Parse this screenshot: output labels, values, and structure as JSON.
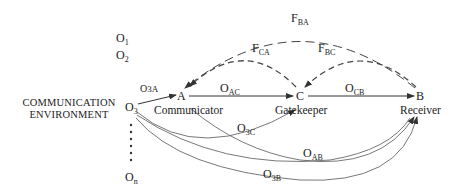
{
  "environment_label": [
    "COMMUNICATION",
    "ENVIRONMENT"
  ],
  "objects": [
    {
      "id": "O1",
      "base": "O",
      "sub": "1"
    },
    {
      "id": "O2",
      "base": "O",
      "sub": "2"
    },
    {
      "id": "O3",
      "base": "O",
      "sub": "3"
    },
    {
      "id": "On",
      "base": "O",
      "sub": "n"
    }
  ],
  "nodes": [
    {
      "id": "A",
      "letter": "A",
      "role": "Communicator"
    },
    {
      "id": "C",
      "letter": "C",
      "role": "Gatekeeper"
    },
    {
      "id": "B",
      "letter": "B",
      "role": "Receiver"
    }
  ],
  "edges": {
    "solid": [
      {
        "label": "O3A",
        "base": "O",
        "sub": "3A",
        "from": "O3",
        "to": "A"
      },
      {
        "label": "OAC",
        "base": "O",
        "sub": "AC",
        "from": "A",
        "to": "C"
      },
      {
        "label": "OCB",
        "base": "O",
        "sub": "CB",
        "from": "C",
        "to": "B"
      },
      {
        "label": "O3C",
        "base": "O",
        "sub": "3C",
        "from": "O3",
        "to": "C"
      },
      {
        "label": "OAB",
        "base": "O",
        "sub": "AB",
        "from": "A",
        "to": "B"
      },
      {
        "label": "O3B",
        "base": "O",
        "sub": "3B",
        "from": "O3",
        "to": "B"
      }
    ],
    "feedback_dashed": [
      {
        "label": "FBA",
        "base": "F",
        "sub": "BA",
        "from": "B",
        "to": "A"
      },
      {
        "label": "FCA",
        "base": "F",
        "sub": "CA",
        "from": "C",
        "to": "A"
      },
      {
        "label": "FBC",
        "base": "F",
        "sub": "BC",
        "from": "B",
        "to": "C"
      }
    ]
  },
  "colors": {
    "line": "#333333",
    "background": "#ffffff"
  }
}
